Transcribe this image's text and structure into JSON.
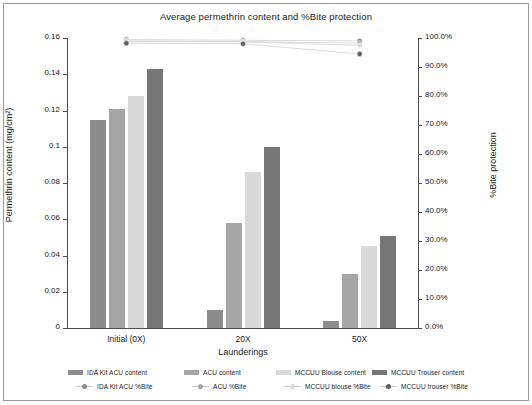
{
  "chart_data": {
    "type": "bar",
    "title": "Average permethrin content and %Bite protection",
    "xlabel": "Launderings",
    "ylabel": "Permethrin content (mg/cm²)",
    "y2label": "%Bite protection",
    "categories": [
      "Initial (0X)",
      "20X",
      "50X"
    ],
    "ylim": [
      0,
      0.16
    ],
    "y2lim": [
      0,
      1.0
    ],
    "grid": false,
    "legend_position": "bottom",
    "yticks": [
      "0",
      "0.02",
      "0.04",
      "0.06",
      "0.08",
      "0.1",
      "0.12",
      "0.14",
      "0.16"
    ],
    "ytick_values": [
      0,
      0.02,
      0.04,
      0.06,
      0.08,
      0.1,
      0.12,
      0.14,
      0.16
    ],
    "y2ticks": [
      "0.0%",
      "10.0%",
      "20.0%",
      "30.0%",
      "40.0%",
      "50.0%",
      "60.0%",
      "70.0%",
      "80.0%",
      "90.0%",
      "100.0%"
    ],
    "y2tick_values": [
      0,
      0.1,
      0.2,
      0.3,
      0.4,
      0.5,
      0.6,
      0.7,
      0.8,
      0.9,
      1.0
    ],
    "bar_series": [
      {
        "name": "IDA Kit ACU content",
        "color": "#8c8c8c",
        "values": [
          0.115,
          0.01,
          0.004
        ]
      },
      {
        "name": "ACU content",
        "color": "#a5a5a5",
        "values": [
          0.121,
          0.058,
          0.03
        ]
      },
      {
        "name": "MCCUU Blouse content",
        "color": "#d9d9d9",
        "values": [
          0.128,
          0.086,
          0.045
        ]
      },
      {
        "name": "MCCUU Trouser content",
        "color": "#767676",
        "values": [
          0.143,
          0.1,
          0.051
        ]
      }
    ],
    "line_series": [
      {
        "name": "IDA Kit ACU %Bite",
        "color": "#8c8c8c",
        "values": [
          0.995,
          0.992,
          0.99
        ]
      },
      {
        "name": "ACU %Bite",
        "color": "#a5a5a5",
        "values": [
          0.99,
          0.988,
          0.982
        ]
      },
      {
        "name": "MCCUU blouse %Bite",
        "color": "#d9d9d9",
        "values": [
          0.988,
          0.986,
          0.975
        ]
      },
      {
        "name": "MCCUU trouser %Bite",
        "color": "#5e5e5e",
        "values": [
          0.982,
          0.98,
          0.945
        ]
      }
    ]
  },
  "legend": {
    "row1": [
      "IDA Kit ACU content",
      "ACU content",
      "MCCUU Blouse content",
      "MCCUU Trouser content"
    ],
    "row2": [
      "IDA Kit ACU %Bite",
      "ACU %Bite",
      "MCCUU blouse %Bite",
      "MCCUU trouser %Bite"
    ]
  }
}
